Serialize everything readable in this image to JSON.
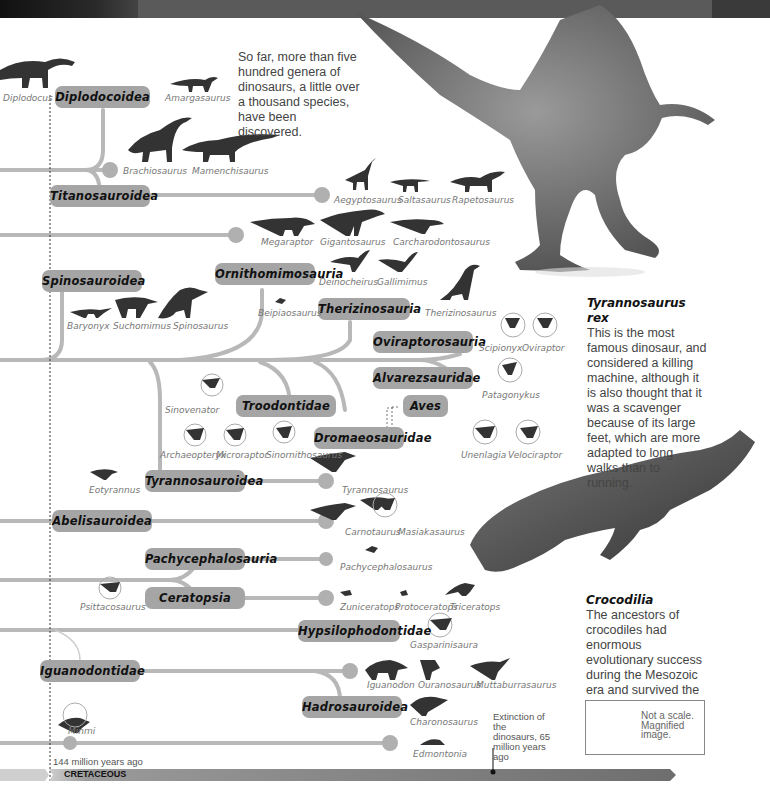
{
  "intro_text": "So far, more than five hundred genera of dinosaurs, a little over a thousand species, have been discovered.",
  "clades": {
    "diplodocoidea": "Diplodocoidea",
    "titanosauroidea": "Titanosauroidea",
    "spinosauroidea": "Spinosauroidea",
    "ornithomimosauria": "Ornithomimosauria",
    "therizinosauria": "Therizinosauria",
    "oviraptorosauria": "Oviraptorosauria",
    "alvarezsauridae": "Alvarezsauridae",
    "aves": "Aves",
    "troodontidae": "Troodontidae",
    "dromaeosauridae": "Dromaeosauridae",
    "tyrannosauroidea": "Tyrannosauroidea",
    "abelisauroidea": "Abelisauroidea",
    "pachycephalosauria": "Pachycephalosauria",
    "ceratopsia": "Ceratopsia",
    "hypsilophodontidae": "Hypsilophodontidae",
    "iguanodontidae": "Iguanodontidae",
    "hadrosauroidea": "Hadrosauroidea"
  },
  "genera": {
    "diplodocus": "Diplodocus",
    "amargasaurus": "Amargasaurus",
    "brachiosaurus": "Brachiosaurus",
    "mamenchisaurus": "Mamenchisaurus",
    "aegyptosaurus": "Aegyptosaurus",
    "saltasaurus": "Saltasaurus",
    "rapetosaurus": "Rapetosaurus",
    "megaraptor": "Megaraptor",
    "gigantosaurus": "Gigantosaurus",
    "carcharodontosaurus": "Carcharodontosaurus",
    "deinocheirus": "Deinocheirus",
    "gallimimus": "Gallimimus",
    "baryonyx": "Baryonyx",
    "suchomimus": "Suchomimus",
    "spinosaurus": "Spinosaurus",
    "beipiaosaurus": "Beipiaosaurus",
    "therizinosaurus": "Therizinosaurus",
    "scipionyx": "Scipionyx",
    "oviraptor": "Oviraptor",
    "patagonykus": "Patagonykus",
    "sinovenator": "Sinovenator",
    "archaeopteryx": "Archaeopteryx",
    "microraptor": "Microraptor",
    "sinornithosaurus": "Sinornithosaurus",
    "unenlagia": "Unenlagia",
    "velociraptor": "Velociraptor",
    "eotyrannus": "Eotyrannus",
    "tyrannosaurus": "Tyrannosaurus",
    "carnotaurus": "Carnotaurus",
    "masiakasaurus": "Masiakasaurus",
    "pachycephalosaurus": "Pachycephalosaurus",
    "psittacosaurus": "Psittacosaurus",
    "zuniceratops": "Zuniceratops",
    "protoceratops": "Protoceratops",
    "triceratops": "Triceratops",
    "gasparinisaura": "Gasparinisaura",
    "iguanodon": "Iguanodon",
    "ouranosaurus": "Ouranosaurus",
    "muttaburrasaurus": "Muttaburrasaurus",
    "charonosaurus": "Charonosaurus",
    "minmi": "Minmi",
    "edmontonia": "Edmontonia"
  },
  "trex_note": {
    "title": "Tyrannosaurus rex",
    "body": "This is the most famous dinosaur, and considered a killing machine, although it is also thought that it was a scavenger because of its large feet, which are more adapted to long walks than to running."
  },
  "croc_note": {
    "title": "Crocodilia",
    "body": "The ancestors of crocodiles had enormous evolutionary success during the Mesozoic era and survived the mass extinction of that time."
  },
  "timeline": {
    "start_label": "144 million years ago",
    "era_label": "CRETACEOUS",
    "extinction_label": "Extinction of the dinosaurs, 65 million years ago"
  },
  "legend": {
    "text": "Not a scale. Magnified image.",
    "icon": "magnifier-plus-icon"
  },
  "colors": {
    "pill": "#a5a5a5",
    "branch": "#b8b8b8",
    "silhouette": "#333333",
    "era_bar": "#6e6e6e"
  }
}
